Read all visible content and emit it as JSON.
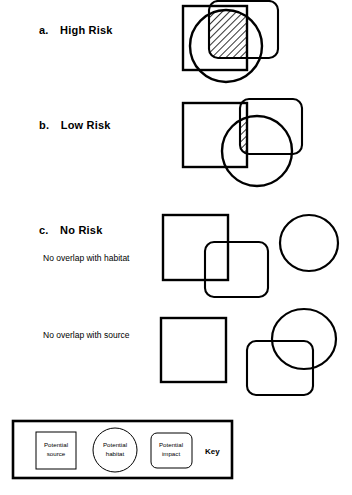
{
  "figure": {
    "title_alt": "Risk overlap diagrams",
    "stroke_color": "#000000",
    "background": "#ffffff",
    "hatch_label": "diagonal-hatch-overlap"
  },
  "rows": [
    {
      "id": "high-risk",
      "letter": "a.",
      "label": "High Risk",
      "sublabel": "",
      "description": "Potential source square, potential habitat circle and potential impact rounded rectangle all overlap; triple overlap region is hatched."
    },
    {
      "id": "low-risk",
      "letter": "b.",
      "label": "Low Risk",
      "sublabel": "",
      "description": "Square, circle and rounded rectangle overlap only in a small hatched corner region."
    },
    {
      "id": "no-risk",
      "letter": "c.",
      "label": "No Risk",
      "sublabel": "No overlap with habitat",
      "description": "Square overlaps rounded rectangle but circle is separate."
    },
    {
      "id": "no-risk-source",
      "letter": "",
      "label": "",
      "sublabel": "No overlap with source",
      "description": "Square is separate; rounded rectangle overlaps circle."
    }
  ],
  "key": {
    "title": "Key",
    "items": [
      {
        "shape": "square",
        "line1": "Potential",
        "line2": "source",
        "name": "potential-source"
      },
      {
        "shape": "circle",
        "line1": "Potential",
        "line2": "habitat",
        "name": "potential-habitat"
      },
      {
        "shape": "rounded-rect",
        "line1": "Potential",
        "line2": "impact",
        "name": "potential-impact"
      }
    ]
  }
}
